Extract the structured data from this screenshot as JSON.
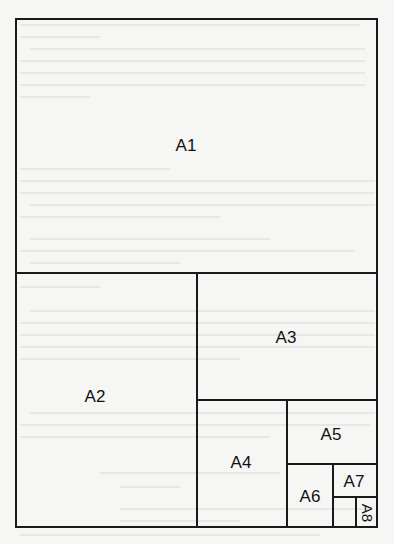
{
  "diagram": {
    "type": "paper-size-subdivision",
    "colors": {
      "background": "#f6f6f4",
      "line": "#1a1a1a",
      "label": "#111111"
    },
    "regions": [
      {
        "id": "A1",
        "label": "A1"
      },
      {
        "id": "A2",
        "label": "A2"
      },
      {
        "id": "A3",
        "label": "A3"
      },
      {
        "id": "A4",
        "label": "A4"
      },
      {
        "id": "A5",
        "label": "A5"
      },
      {
        "id": "A6",
        "label": "A6"
      },
      {
        "id": "A7",
        "label": "A7"
      },
      {
        "id": "A8",
        "label": "A8"
      }
    ]
  }
}
